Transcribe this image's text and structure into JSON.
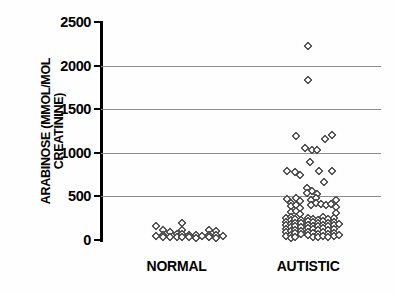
{
  "chart_data": {
    "type": "scatter",
    "title": "",
    "subtitle": "",
    "xlabel": "",
    "ylabel": "ARABINOSE (MMOL/MOL\nCREATININE)",
    "ylim": [
      0,
      2500
    ],
    "yticks": [
      0,
      500,
      1000,
      1500,
      2000,
      2500
    ],
    "ytick_labels": [
      "0",
      "500",
      "1000",
      "1500",
      "2000",
      "2500"
    ],
    "gridlines": [
      500,
      1000,
      1500,
      2000
    ],
    "grid": true,
    "legend": null,
    "legend_position": "none",
    "marker": "open-diamond",
    "categories": [
      "NORMAL",
      "AUTISTIC"
    ],
    "series": [
      {
        "name": "NORMAL",
        "x_center": 0.27,
        "n": 25,
        "points": [
          {
            "x": -0.075,
            "y": 155
          },
          {
            "x": -0.075,
            "y": 50
          },
          {
            "x": -0.05,
            "y": 110
          },
          {
            "x": -0.05,
            "y": 62
          },
          {
            "x": -0.05,
            "y": 35
          },
          {
            "x": -0.022,
            "y": 95
          },
          {
            "x": -0.022,
            "y": 40
          },
          {
            "x": 0.0,
            "y": 70
          },
          {
            "x": 0.0,
            "y": 32
          },
          {
            "x": 0.02,
            "y": 195
          },
          {
            "x": 0.02,
            "y": 120
          },
          {
            "x": 0.02,
            "y": 70
          },
          {
            "x": 0.02,
            "y": 35
          },
          {
            "x": 0.044,
            "y": 60
          },
          {
            "x": 0.044,
            "y": 30
          },
          {
            "x": 0.068,
            "y": 55
          },
          {
            "x": 0.068,
            "y": 28
          },
          {
            "x": 0.092,
            "y": 50
          },
          {
            "x": 0.116,
            "y": 115
          },
          {
            "x": 0.116,
            "y": 60
          },
          {
            "x": 0.116,
            "y": 30
          },
          {
            "x": 0.14,
            "y": 105
          },
          {
            "x": 0.14,
            "y": 55
          },
          {
            "x": 0.14,
            "y": 28
          },
          {
            "x": 0.164,
            "y": 45
          }
        ]
      },
      {
        "name": "AUTISTIC",
        "x_center": 0.74,
        "n": 101,
        "points": [
          {
            "x": 0.0,
            "y": 2225
          },
          {
            "x": 0.0,
            "y": 1830
          },
          {
            "x": -0.045,
            "y": 1190
          },
          {
            "x": 0.06,
            "y": 1160
          },
          {
            "x": 0.085,
            "y": 1205
          },
          {
            "x": -0.012,
            "y": 1055
          },
          {
            "x": 0.012,
            "y": 1030
          },
          {
            "x": 0.032,
            "y": 1030
          },
          {
            "x": 0.005,
            "y": 895
          },
          {
            "x": -0.075,
            "y": 795
          },
          {
            "x": -0.048,
            "y": 775
          },
          {
            "x": -0.03,
            "y": 750
          },
          {
            "x": 0.04,
            "y": 790
          },
          {
            "x": 0.085,
            "y": 790
          },
          {
            "x": 0.055,
            "y": 660
          },
          {
            "x": -0.006,
            "y": 600
          },
          {
            "x": 0.012,
            "y": 560
          },
          {
            "x": -0.006,
            "y": 540
          },
          {
            "x": 0.03,
            "y": 530
          },
          {
            "x": -0.075,
            "y": 465
          },
          {
            "x": -0.06,
            "y": 430
          },
          {
            "x": -0.06,
            "y": 385
          },
          {
            "x": -0.06,
            "y": 320
          },
          {
            "x": -0.045,
            "y": 480
          },
          {
            "x": -0.045,
            "y": 400
          },
          {
            "x": -0.045,
            "y": 335
          },
          {
            "x": -0.03,
            "y": 450
          },
          {
            "x": -0.03,
            "y": 370
          },
          {
            "x": -0.03,
            "y": 300
          },
          {
            "x": 0.01,
            "y": 455
          },
          {
            "x": 0.01,
            "y": 400
          },
          {
            "x": 0.028,
            "y": 480
          },
          {
            "x": 0.028,
            "y": 420
          },
          {
            "x": 0.045,
            "y": 415
          },
          {
            "x": 0.062,
            "y": 400
          },
          {
            "x": 0.08,
            "y": 415
          },
          {
            "x": 0.098,
            "y": 455
          },
          {
            "x": 0.098,
            "y": 375
          },
          {
            "x": 0.098,
            "y": 310
          },
          {
            "x": -0.08,
            "y": 250
          },
          {
            "x": -0.08,
            "y": 210
          },
          {
            "x": -0.08,
            "y": 170
          },
          {
            "x": -0.08,
            "y": 130
          },
          {
            "x": -0.08,
            "y": 90
          },
          {
            "x": -0.08,
            "y": 50
          },
          {
            "x": -0.063,
            "y": 265
          },
          {
            "x": -0.063,
            "y": 225
          },
          {
            "x": -0.063,
            "y": 185
          },
          {
            "x": -0.063,
            "y": 145
          },
          {
            "x": -0.063,
            "y": 105
          },
          {
            "x": -0.063,
            "y": 62
          },
          {
            "x": -0.063,
            "y": 28
          },
          {
            "x": -0.046,
            "y": 240
          },
          {
            "x": -0.046,
            "y": 200
          },
          {
            "x": -0.046,
            "y": 160
          },
          {
            "x": -0.046,
            "y": 118
          },
          {
            "x": -0.046,
            "y": 76
          },
          {
            "x": -0.046,
            "y": 36
          },
          {
            "x": -0.024,
            "y": 230
          },
          {
            "x": -0.024,
            "y": 190
          },
          {
            "x": -0.024,
            "y": 150
          },
          {
            "x": -0.024,
            "y": 108
          },
          {
            "x": -0.024,
            "y": 66
          },
          {
            "x": -0.002,
            "y": 255
          },
          {
            "x": -0.002,
            "y": 215
          },
          {
            "x": -0.002,
            "y": 175
          },
          {
            "x": -0.002,
            "y": 135
          },
          {
            "x": -0.002,
            "y": 95
          },
          {
            "x": -0.002,
            "y": 52
          },
          {
            "x": 0.016,
            "y": 245
          },
          {
            "x": 0.016,
            "y": 205
          },
          {
            "x": 0.016,
            "y": 165
          },
          {
            "x": 0.016,
            "y": 122
          },
          {
            "x": 0.016,
            "y": 80
          },
          {
            "x": 0.016,
            "y": 40
          },
          {
            "x": 0.034,
            "y": 235
          },
          {
            "x": 0.034,
            "y": 195
          },
          {
            "x": 0.034,
            "y": 155
          },
          {
            "x": 0.034,
            "y": 112
          },
          {
            "x": 0.034,
            "y": 70
          },
          {
            "x": 0.034,
            "y": 30
          },
          {
            "x": 0.052,
            "y": 260
          },
          {
            "x": 0.052,
            "y": 218
          },
          {
            "x": 0.052,
            "y": 176
          },
          {
            "x": 0.052,
            "y": 134
          },
          {
            "x": 0.052,
            "y": 92
          },
          {
            "x": 0.052,
            "y": 48
          },
          {
            "x": 0.07,
            "y": 240
          },
          {
            "x": 0.07,
            "y": 198
          },
          {
            "x": 0.07,
            "y": 156
          },
          {
            "x": 0.07,
            "y": 114
          },
          {
            "x": 0.07,
            "y": 72
          },
          {
            "x": 0.07,
            "y": 32
          },
          {
            "x": 0.092,
            "y": 255
          },
          {
            "x": 0.092,
            "y": 212
          },
          {
            "x": 0.092,
            "y": 170
          },
          {
            "x": 0.092,
            "y": 128
          },
          {
            "x": 0.092,
            "y": 86
          },
          {
            "x": 0.092,
            "y": 44
          },
          {
            "x": 0.11,
            "y": 180
          },
          {
            "x": 0.11,
            "y": 60
          }
        ]
      }
    ]
  }
}
